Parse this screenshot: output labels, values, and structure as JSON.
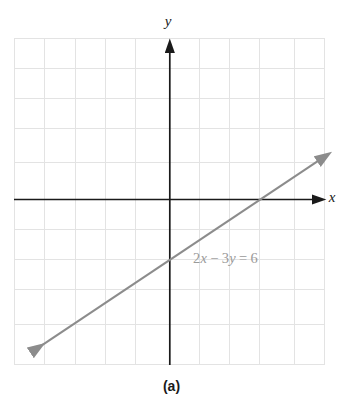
{
  "figure": {
    "caption": "(a)",
    "equation": {
      "full": "2x − 3y = 6",
      "coef_x": "2",
      "var_x": "x",
      "op": "−",
      "coef_y": "3",
      "var_y": "y",
      "equals": "=",
      "rhs": "6"
    },
    "axis_labels": {
      "x": "x",
      "y": "y"
    },
    "colors": {
      "line": "#8c8c8c",
      "axis": "#1a1a1a",
      "grid": "#e3e3e3",
      "label": "#9a9a9a",
      "background": "#ffffff"
    }
  },
  "chart_data": {
    "type": "line",
    "title": "",
    "subtitle": "",
    "caption": "(a)",
    "xlabel": "x",
    "ylabel": "y",
    "annotations": [
      {
        "text": "2x − 3y = 6",
        "x": 1.6,
        "y": -2.1,
        "color": "#9a9a9a"
      }
    ],
    "grid": true,
    "grid_step": 1,
    "legend": "none",
    "xlim": [
      -5.2,
      5.2
    ],
    "ylim": [
      -5.5,
      5.4
    ],
    "axes": {
      "x_axis_y": 0,
      "y_axis_x": 0,
      "arrows": [
        "x-positive",
        "y-positive"
      ],
      "ticks_labeled": false
    },
    "series": [
      {
        "name": "2x - 3y = 6",
        "equation": "2x - 3y = 6",
        "slope": 0.6667,
        "intercept": -2,
        "x_intercept": 3,
        "y_intercept": -2,
        "color": "#8c8c8c",
        "arrows": "both",
        "x": [
          -4.55,
          4.95
        ],
        "y": [
          -5.03,
          1.3
        ]
      }
    ]
  }
}
